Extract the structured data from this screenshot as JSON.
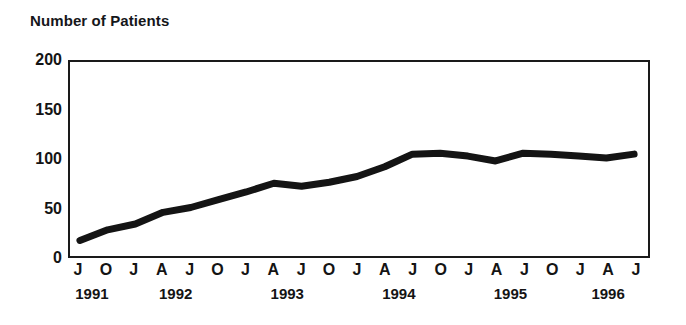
{
  "chart_data": {
    "type": "line",
    "title": "Number of Patients",
    "xlabel": "",
    "ylabel": "",
    "ylim": [
      0,
      200
    ],
    "yticks": [
      0,
      50,
      100,
      150,
      200
    ],
    "grid": false,
    "legend": null,
    "x_axis": {
      "tick_labels": [
        "J",
        "O",
        "J",
        "A",
        "J",
        "O",
        "J",
        "A",
        "J",
        "O",
        "J",
        "A",
        "J",
        "O",
        "J",
        "A",
        "J",
        "O",
        "J",
        "A",
        "J"
      ],
      "year_groups": [
        {
          "year": "1991",
          "months": [
            "J",
            "O"
          ]
        },
        {
          "year": "1992",
          "months": [
            "J",
            "A",
            "J",
            "O"
          ]
        },
        {
          "year": "1993",
          "months": [
            "J",
            "A",
            "J",
            "O"
          ]
        },
        {
          "year": "1994",
          "months": [
            "J",
            "A",
            "J",
            "O"
          ]
        },
        {
          "year": "1995",
          "months": [
            "J",
            "A",
            "J",
            "O"
          ]
        },
        {
          "year": "1996",
          "months": [
            "J",
            "A",
            "J"
          ]
        }
      ]
    },
    "series": [
      {
        "name": "Number of Patients",
        "color": "#141414",
        "x": [
          "1991-07",
          "1991-10",
          "1992-01",
          "1992-04",
          "1992-07",
          "1992-10",
          "1993-01",
          "1993-04",
          "1993-07",
          "1993-10",
          "1994-01",
          "1994-04",
          "1994-07",
          "1994-10",
          "1995-01",
          "1995-04",
          "1995-07",
          "1995-10",
          "1996-01",
          "1996-04",
          "1996-07"
        ],
        "values": [
          16,
          27,
          33,
          45,
          50,
          58,
          66,
          75,
          72,
          76,
          82,
          92,
          105,
          106,
          103,
          98,
          106,
          105,
          103,
          101,
          105
        ]
      }
    ]
  }
}
